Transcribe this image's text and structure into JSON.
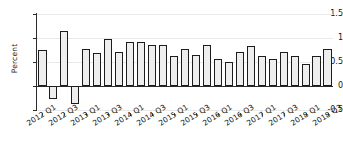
{
  "chart_data": {
    "type": "bar",
    "title": "",
    "subtitle": "",
    "xlabel": "",
    "ylabel": "Percent",
    "ylim": [
      -0.5,
      1.5
    ],
    "yticks": [
      -0.5,
      0,
      0.5,
      1,
      1.5
    ],
    "ytick_labels": [
      "-0.5",
      "0",
      "0.5",
      "1",
      "1.5"
    ],
    "grid": true,
    "legend": null,
    "legend_position": "none",
    "bar_fill_color": "#eeeeee",
    "bar_edge_color": "#1c1c1c",
    "categories": [
      "2012 Q1",
      "2012 Q2",
      "2012 Q3",
      "2012 Q4",
      "2013 Q1",
      "2013 Q2",
      "2013 Q3",
      "2013 Q4",
      "2014 Q1",
      "2014 Q2",
      "2014 Q3",
      "2014 Q4",
      "2015 Q1",
      "2015 Q2",
      "2015 Q3",
      "2015 Q4",
      "2016 Q1",
      "2016 Q2",
      "2016 Q3",
      "2016 Q4",
      "2017 Q1",
      "2017 Q2",
      "2017 Q3",
      "2017 Q4",
      "2018 Q1",
      "2018 Q2",
      "2018 Q3"
    ],
    "values": [
      0.76,
      -0.28,
      1.14,
      -0.38,
      0.77,
      0.69,
      0.98,
      0.7,
      0.91,
      0.91,
      0.85,
      0.85,
      0.63,
      0.78,
      0.64,
      0.85,
      0.56,
      0.5,
      0.71,
      0.83,
      0.62,
      0.57,
      0.71,
      0.62,
      0.45,
      0.62,
      0.77
    ],
    "xtick_labels": [
      "2012 Q1",
      "2012 Q3",
      "2013 Q1",
      "2013 Q3",
      "2014 Q1",
      "2014 Q3",
      "2015 Q1",
      "2015 Q3",
      "2016 Q1",
      "2016 Q3",
      "2017 Q1",
      "2017 Q3",
      "2018 Q1",
      "2018 Q3"
    ],
    "xtick_indices": [
      0,
      2,
      4,
      6,
      8,
      10,
      12,
      14,
      16,
      18,
      20,
      22,
      24,
      26
    ]
  }
}
